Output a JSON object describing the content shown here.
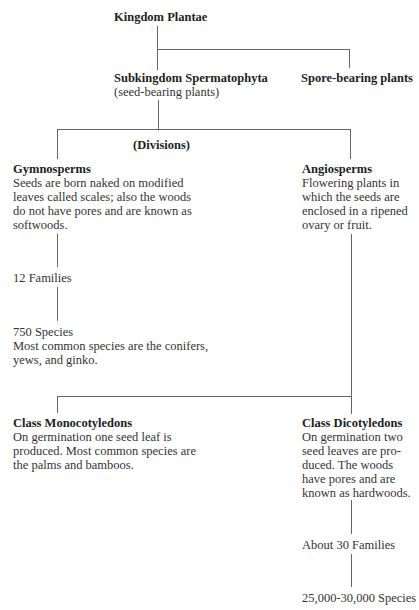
{
  "diagram": {
    "type": "taxonomy-tree",
    "root": {
      "title": "Kingdom Plantae"
    },
    "subkingdom": {
      "title": "Subkingdom Spermatophyta",
      "subtitle": "(seed-bearing plants)"
    },
    "spore": {
      "title": "Spore-bearing plants"
    },
    "divisions_label": "(Divisions)",
    "gymnosperms": {
      "title": "Gymnosperms",
      "lines": [
        "Seeds are born naked on modified",
        "leaves called scales; also the woods",
        "do not have pores and are known as",
        "softwoods."
      ],
      "families": "12 Families",
      "species": "750 Species",
      "species_note_lines": [
        "Most common species are the conifers,",
        "yews, and ginko."
      ]
    },
    "angiosperms": {
      "title": "Angiosperms",
      "lines": [
        "Flowering plants in",
        "which the seeds are",
        "enclosed in a ripened",
        "ovary or fruit."
      ]
    },
    "monocots": {
      "title": "Class Monocotyledons",
      "lines": [
        "On germination one seed leaf is",
        "produced. Most common species are",
        "the palms and bamboos."
      ]
    },
    "dicots": {
      "title": "Class Dicotyledons",
      "lines": [
        "On germination two",
        "seed leaves are pro-",
        "duced. The woods",
        "have pores and are",
        "known as hardwoods."
      ],
      "families": "About 30 Families",
      "species": "25,000-30,000 Species"
    },
    "line_color": "#666666",
    "text_color": "#2a2a2a"
  }
}
